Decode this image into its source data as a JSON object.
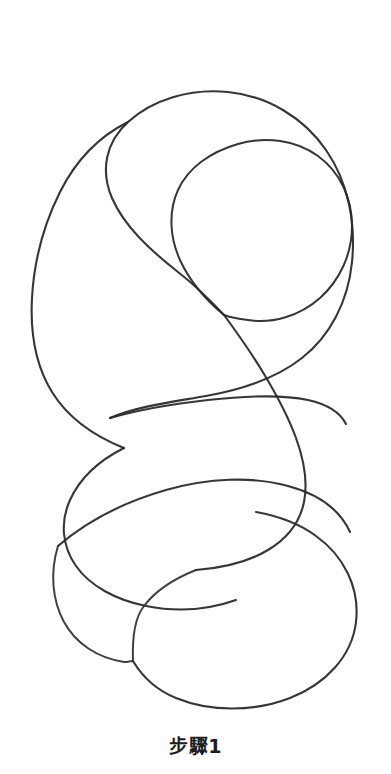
{
  "page": {
    "background_color": "#ffffff",
    "width": 391,
    "height": 774
  },
  "caption": {
    "text": "步驟1",
    "color": "#1d1d1d"
  },
  "illustration": {
    "name": "hand-drawn-coil-sketch",
    "description": "手繪連續螺旋線稿",
    "ink_color": "#2b2b2b",
    "ink_color_light": "#555555",
    "stroke_width": 2,
    "strokes": [
      {
        "id": "outer-coil-upper",
        "label": "外圈上方大迴圈",
        "color": "#2b2b2b",
        "width": 2.1,
        "opacity": 0.95,
        "d": "M224,315 C210,300 196,286 178,272 C150,250 124,226 112,198 C100,170 106,142 128,122 C152,100 190,88 228,92 C268,96 304,118 326,150 C348,182 356,222 352,262 C348,302 330,336 302,358 C274,380 240,390 206,396 C172,402 138,406 110,418"
      },
      {
        "id": "outer-coil-left-descender",
        "label": "外圈左側下行線",
        "color": "#2b2b2b",
        "width": 2.1,
        "opacity": 0.95,
        "d": "M128,122 C100,136 76,160 60,192 C44,224 34,262 32,298 C30,334 36,366 52,392 C68,418 94,436 124,448"
      },
      {
        "id": "inner-loop",
        "label": "內圈小迴圈",
        "color": "#2b2b2b",
        "width": 2.0,
        "opacity": 0.95,
        "d": "M224,315 C206,300 190,282 180,260 C170,238 168,212 178,190 C188,168 210,152 238,144 C266,136 296,140 318,156 C340,172 352,198 352,226 C352,254 340,280 320,298 C300,316 272,324 248,320 C240,319 232,318 224,315"
      },
      {
        "id": "mid-sweep-right",
        "label": "中段右側長弧",
        "color": "#2b2b2b",
        "width": 2.1,
        "opacity": 0.95,
        "d": "M224,315 C238,334 252,354 264,374 C276,394 288,416 296,438 C304,460 308,482 304,502 C300,522 288,538 268,550 C248,562 222,568 196,570"
      },
      {
        "id": "mid-band-left",
        "label": "中段左側帶狀弧",
        "color": "#2b2b2b",
        "width": 2.1,
        "opacity": 0.95,
        "d": "M110,418 C138,410 172,404 208,400 C244,396 280,394 308,400 C326,404 340,412 346,424"
      },
      {
        "id": "mid-loop-lower-left",
        "label": "中段左下迴圈",
        "color": "#2b2b2b",
        "width": 2.1,
        "opacity": 0.95,
        "d": "M124,448 C100,460 80,478 70,500 C60,522 62,546 76,566 C90,586 116,600 146,606 C176,612 208,610 236,600"
      },
      {
        "id": "lower-band",
        "label": "下段橫向帶弧",
        "color": "#2b2b2b",
        "width": 2.1,
        "opacity": 0.95,
        "d": "M58,546 C86,522 124,502 166,490 C208,478 252,476 288,486 C318,494 340,510 350,532"
      },
      {
        "id": "bottom-loop-left",
        "label": "左下收尾迴圈",
        "color": "#2b2b2b",
        "width": 2.0,
        "opacity": 0.9,
        "d": "M58,546 C50,572 52,600 64,622 C76,644 98,658 124,662 C128,662 130,661 133,661"
      },
      {
        "id": "bottom-loop-right",
        "label": "右下大收尾迴圈",
        "color": "#2b2b2b",
        "width": 2.1,
        "opacity": 0.95,
        "d": "M133,661 C142,676 156,690 176,698 C210,712 254,712 290,698 C326,684 352,656 356,622 C360,588 344,556 316,536 C300,524 278,516 256,512"
      },
      {
        "id": "bottom-tail",
        "label": "尾端線",
        "color": "#2b2b2b",
        "width": 2.0,
        "opacity": 0.9,
        "d": "M196,570 C176,578 156,590 144,606 C136,616 132,634 133,661"
      }
    ]
  }
}
